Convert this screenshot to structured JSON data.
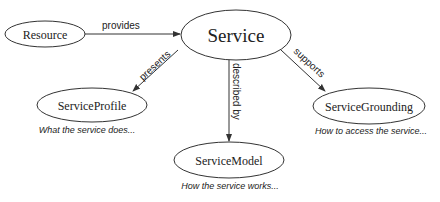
{
  "diagram": {
    "nodes": [
      {
        "id": "resource",
        "label": "Resource"
      },
      {
        "id": "service",
        "label": "Service"
      },
      {
        "id": "profile",
        "label": "ServiceProfile",
        "caption": "What the service does..."
      },
      {
        "id": "model",
        "label": "ServiceModel",
        "caption": "How the service works..."
      },
      {
        "id": "grounding",
        "label": "ServiceGrounding",
        "caption": "How to access the service..."
      }
    ],
    "edges": [
      {
        "from": "resource",
        "to": "service",
        "label": "provides"
      },
      {
        "from": "service",
        "to": "profile",
        "label": "presents"
      },
      {
        "from": "service",
        "to": "model",
        "label": "described by"
      },
      {
        "from": "service",
        "to": "grounding",
        "label": "supports"
      }
    ]
  }
}
